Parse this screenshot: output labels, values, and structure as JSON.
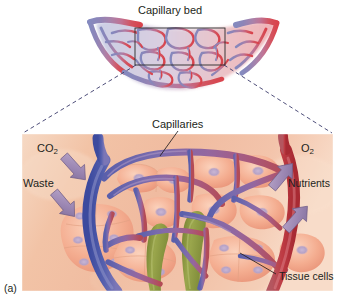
{
  "figure": {
    "letter": "(a)",
    "type": "anatomical-illustration"
  },
  "top_panel": {
    "title": "Capillary bed",
    "description": "Capillary bed network shading from blue (venous, left) to red (arterial, right)",
    "inset_box": {
      "x": 135,
      "y": 28,
      "width": 90,
      "height": 37
    },
    "venule_color": "#7b7fb5",
    "arteriole_color": "#d2414a"
  },
  "detail_panel": {
    "background_color": "#f0bda4",
    "labels": {
      "capillaries": "Capillaries",
      "tissue_cells": "Tissue cells"
    },
    "exchange_arrows": [
      {
        "label": "CO",
        "sub": "2",
        "direction": "into-blood",
        "color": "#9b87b5"
      },
      {
        "label": "Waste",
        "sub": "",
        "direction": "into-blood",
        "color": "#9b87b5"
      },
      {
        "label": "O",
        "sub": "2",
        "direction": "into-tissue",
        "color": "#9b87b5"
      },
      {
        "label": "Nutrients",
        "sub": "",
        "direction": "into-tissue",
        "color": "#9b87b5"
      }
    ],
    "vessel_colors": {
      "venule": "#4a56a6",
      "capillary": "#8f6fa8",
      "arteriole": "#b5313a",
      "lymphatic": "#8a9641",
      "tissue_cell": "#f3a98e",
      "cell_nucleus": "#b9a7c4"
    }
  },
  "connectors": {
    "style": "dashed",
    "color": "#3b3b6b"
  }
}
